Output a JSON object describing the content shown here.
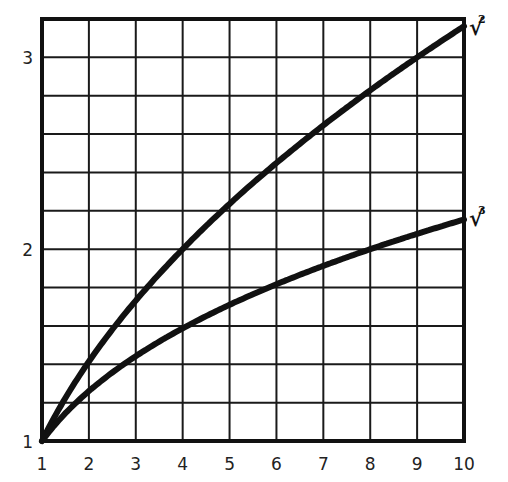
{
  "chart_data": {
    "type": "line",
    "title": "",
    "xlabel": "",
    "ylabel": "",
    "xlim": [
      1,
      10
    ],
    "ylim": [
      1,
      3.2
    ],
    "grid": true,
    "x_ticks": [
      "1",
      "2",
      "3",
      "4",
      "5",
      "6",
      "7",
      "8",
      "9",
      "10"
    ],
    "y_ticks": [
      "1",
      "2",
      "3"
    ],
    "x": [
      1,
      2,
      3,
      4,
      5,
      6,
      7,
      8,
      9,
      10
    ],
    "series": [
      {
        "name": "square root",
        "label": "√",
        "index": "2",
        "values": [
          1.0,
          1.414,
          1.732,
          2.0,
          2.236,
          2.449,
          2.646,
          2.828,
          3.0,
          3.162
        ]
      },
      {
        "name": "cube root",
        "label": "√",
        "index": "3",
        "values": [
          1.0,
          1.26,
          1.442,
          1.587,
          1.71,
          1.817,
          1.913,
          2.0,
          2.08,
          2.154
        ]
      }
    ],
    "colors": {
      "line": "#111111",
      "grid": "#1a1a1a",
      "background": "#ffffff"
    }
  }
}
